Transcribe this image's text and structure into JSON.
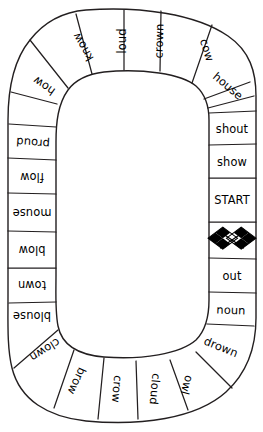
{
  "board": {
    "title": "ow / ou word board game track",
    "shape": "rounded-rectangle-loop",
    "background_color": "#ffffff",
    "line_color": "#231f20",
    "text_color": "#000000",
    "cell_count": 24,
    "start_label": "START",
    "finish_icon": "checkered-flags-icon"
  },
  "cells": [
    {
      "id": "c01",
      "label": "START",
      "type": "start",
      "side": "right"
    },
    {
      "id": "c02",
      "label": "",
      "type": "finish",
      "side": "right",
      "icon": "checkered-flags-icon"
    },
    {
      "id": "c03",
      "label": "out",
      "type": "word",
      "side": "right"
    },
    {
      "id": "c04",
      "label": "noun",
      "type": "word",
      "side": "right"
    },
    {
      "id": "c05",
      "label": "drown",
      "type": "word",
      "side": "corner-br"
    },
    {
      "id": "c06",
      "label": "owl",
      "type": "word",
      "side": "corner-br"
    },
    {
      "id": "c07",
      "label": "cloud",
      "type": "word",
      "side": "bottom"
    },
    {
      "id": "c08",
      "label": "crow",
      "type": "word",
      "side": "bottom"
    },
    {
      "id": "c09",
      "label": "brow",
      "type": "word",
      "side": "corner-bl"
    },
    {
      "id": "c10",
      "label": "clown",
      "type": "word",
      "side": "corner-bl"
    },
    {
      "id": "c11",
      "label": "blouse",
      "type": "word",
      "side": "left"
    },
    {
      "id": "c12",
      "label": "town",
      "type": "word",
      "side": "left"
    },
    {
      "id": "c13",
      "label": "blow",
      "type": "word",
      "side": "left"
    },
    {
      "id": "c14",
      "label": "mouse",
      "type": "word",
      "side": "left"
    },
    {
      "id": "c15",
      "label": "flow",
      "type": "word",
      "side": "left"
    },
    {
      "id": "c16",
      "label": "proud",
      "type": "word",
      "side": "left"
    },
    {
      "id": "c17",
      "label": "how",
      "type": "word",
      "side": "corner-tl"
    },
    {
      "id": "c18",
      "label": "know",
      "type": "word",
      "side": "corner-tl"
    },
    {
      "id": "c19",
      "label": "loud",
      "type": "word",
      "side": "top"
    },
    {
      "id": "c20",
      "label": "crown",
      "type": "word",
      "side": "top"
    },
    {
      "id": "c21",
      "label": "cow",
      "type": "word",
      "side": "corner-tr"
    },
    {
      "id": "c22",
      "label": "house",
      "type": "word",
      "side": "corner-tr"
    },
    {
      "id": "c23",
      "label": "shout",
      "type": "word",
      "side": "right"
    },
    {
      "id": "c24",
      "label": "show",
      "type": "word",
      "side": "right"
    }
  ]
}
